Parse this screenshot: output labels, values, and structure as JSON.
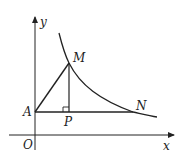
{
  "diagram": {
    "type": "coordinate-geometry",
    "axes": {
      "x_label": "x",
      "y_label": "y",
      "origin_label": "O"
    },
    "points": {
      "A": {
        "label": "A",
        "x": 35,
        "y": 112
      },
      "P": {
        "label": "P",
        "x": 69,
        "y": 112
      },
      "M": {
        "label": "M",
        "x": 69,
        "y": 63
      },
      "N": {
        "label": "N",
        "x": 133,
        "y": 112
      }
    },
    "segments": [
      "AM",
      "MP",
      "AN"
    ],
    "right_angle_at": "P",
    "curve": "decreasing curve through M and N"
  },
  "colors": {
    "stroke": "#222222",
    "background": "#ffffff"
  }
}
